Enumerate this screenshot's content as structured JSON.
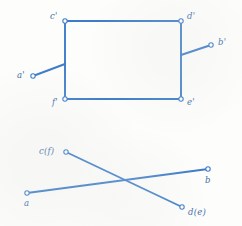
{
  "figure": {
    "background_color": "#fdfdfc",
    "stroke_color": "#3d7cc9",
    "label_color": "#3f6fa8",
    "marker_fill": "#ffffff",
    "stroke_width": 1.9,
    "marker_radius": 2.2
  },
  "views": [
    {
      "name": "elevation-view",
      "description": "front view: rectangle c'-d'-e'-f' with two inclined stub edges a' and b'",
      "vertices": [
        {
          "id": "c-prime",
          "label": "c'",
          "x": 65,
          "y": 21,
          "label_x": 50,
          "label_y": 12
        },
        {
          "id": "d-prime",
          "label": "d'",
          "x": 181,
          "y": 21,
          "label_x": 187,
          "label_y": 12
        },
        {
          "id": "e-prime",
          "label": "e'",
          "x": 181,
          "y": 99,
          "label_x": 187,
          "label_y": 98
        },
        {
          "id": "f-prime",
          "label": "f'",
          "x": 65,
          "y": 99,
          "label_x": 52,
          "label_y": 98
        },
        {
          "id": "a-prime",
          "label": "a'",
          "x": 33,
          "y": 76,
          "label_x": 17,
          "label_y": 71
        },
        {
          "id": "b-prime",
          "label": "b'",
          "x": 211,
          "y": 45,
          "label_x": 218,
          "label_y": 38
        }
      ],
      "edges": [
        {
          "id": "edge-c-d",
          "from": "c-prime",
          "to": "d-prime"
        },
        {
          "id": "edge-d-e",
          "from": "d-prime",
          "to": "e-prime"
        },
        {
          "id": "edge-e-f",
          "from": "e-prime",
          "to": "f-prime"
        },
        {
          "id": "edge-f-c",
          "from": "f-prime",
          "to": "c-prime"
        },
        {
          "id": "edge-a-prime-stub",
          "from": "a-prime",
          "to": {
            "x": 65,
            "y": 64
          }
        },
        {
          "id": "edge-b-prime-stub",
          "from": "b-prime",
          "to": {
            "x": 181,
            "y": 55
          }
        }
      ]
    },
    {
      "name": "plan-view",
      "description": "top view: two crossing straight lines, coincident-point labels in parentheses",
      "vertices": [
        {
          "id": "c-f",
          "label": "c(f)",
          "x": 66,
          "y": 152,
          "label_x": 39,
          "label_y": 147
        },
        {
          "id": "d-e",
          "label": "d(e)",
          "x": 182,
          "y": 207,
          "label_x": 188,
          "label_y": 208
        },
        {
          "id": "a",
          "label": "a",
          "x": 27,
          "y": 193,
          "label_x": 24,
          "label_y": 199
        },
        {
          "id": "b",
          "label": "b",
          "x": 208,
          "y": 169,
          "label_x": 205,
          "label_y": 176
        }
      ],
      "edges": [
        {
          "id": "edge-cf-de",
          "from": "c-f",
          "to": "d-e"
        },
        {
          "id": "edge-a-b",
          "from": "a",
          "to": "b"
        }
      ]
    }
  ]
}
